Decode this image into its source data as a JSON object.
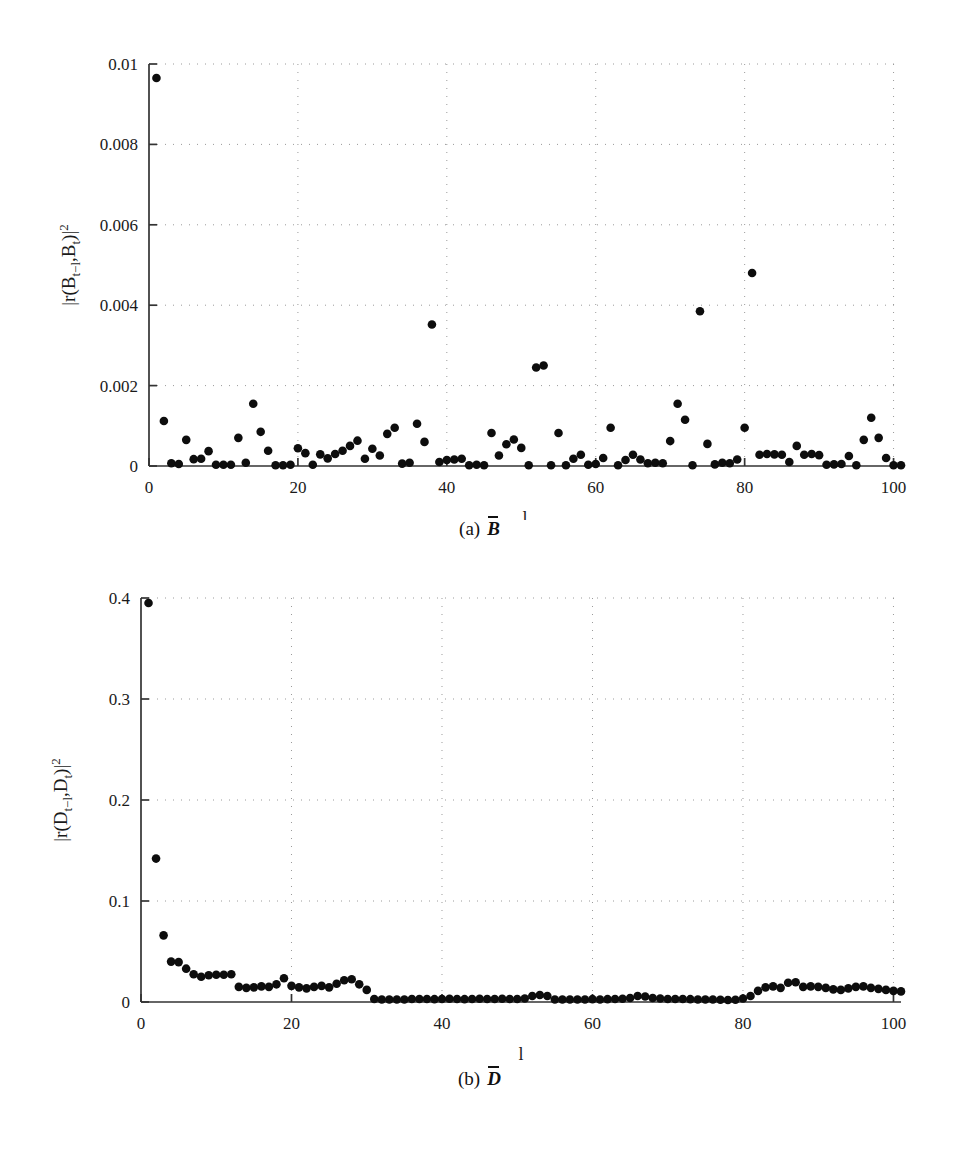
{
  "figure": {
    "background": "#ffffff",
    "marker_color": "#0d0d0d",
    "axis_color": "#333333",
    "grid_color": "#9a9a9a"
  },
  "panels": [
    {
      "id": "panel-a",
      "caption_label": "(a)",
      "caption_symbol": "B",
      "caption_overbar": true,
      "xlabel": "l",
      "ylabel_text": "|r(B_t-l ,B_t)|^2",
      "ylabel_parts": {
        "open": "|r(B",
        "sub1": "t−l",
        "comma": ",B",
        "sub2": "t",
        "close": ")|",
        "sup": "2"
      },
      "x_ticks": [
        "0",
        "20",
        "40",
        "60",
        "80",
        "100"
      ],
      "y_ticks": [
        "0",
        "0.002",
        "0.004",
        "0.006",
        "0.008",
        "0.01"
      ]
    },
    {
      "id": "panel-b",
      "caption_label": "(b)",
      "caption_symbol": "D",
      "caption_overbar": true,
      "xlabel": "l",
      "ylabel_text": "|r(D_t-l ,D_t)|^2",
      "ylabel_parts": {
        "open": "|r(D",
        "sub1": "t−l",
        "comma": ",D",
        "sub2": "t",
        "close": ")|",
        "sup": "2"
      },
      "x_ticks": [
        "0",
        "20",
        "40",
        "60",
        "80",
        "100"
      ],
      "y_ticks": [
        "0",
        "0.1",
        "0.2",
        "0.3",
        "0.4"
      ]
    }
  ],
  "chart_data": [
    {
      "type": "scatter",
      "panel": "a",
      "title": "(a) B̄",
      "xlabel": "l",
      "ylabel": "|r(B_{t-l},B_t)|^2",
      "xlim": [
        0,
        101
      ],
      "ylim": [
        0,
        0.01
      ],
      "xticks": [
        0,
        20,
        40,
        60,
        80,
        100
      ],
      "yticks": [
        0,
        0.002,
        0.004,
        0.006,
        0.008,
        0.01
      ],
      "grid": true,
      "legend": null,
      "marker": "filled-circle",
      "x": [
        1,
        2,
        3,
        4,
        5,
        6,
        7,
        8,
        9,
        10,
        11,
        12,
        13,
        14,
        15,
        16,
        17,
        18,
        19,
        20,
        21,
        22,
        23,
        24,
        25,
        26,
        27,
        28,
        29,
        30,
        31,
        32,
        33,
        34,
        35,
        36,
        37,
        38,
        39,
        40,
        41,
        42,
        43,
        44,
        45,
        46,
        47,
        48,
        49,
        50,
        51,
        52,
        53,
        54,
        55,
        56,
        57,
        58,
        59,
        60,
        61,
        62,
        63,
        64,
        65,
        66,
        67,
        68,
        69,
        70,
        71,
        72,
        73,
        74,
        75,
        76,
        77,
        78,
        79,
        80,
        81,
        82,
        83,
        84,
        85,
        86,
        87,
        88,
        89,
        90,
        91,
        92,
        93,
        94,
        95,
        96,
        97,
        98,
        99,
        100,
        101
      ],
      "y": [
        0.00965,
        0.00112,
        7e-05,
        5e-05,
        0.00065,
        0.00017,
        0.00018,
        0.00037,
        3e-05,
        3e-05,
        3e-05,
        0.0007,
        8e-05,
        0.00155,
        0.00085,
        0.00038,
        2e-05,
        2e-05,
        3e-05,
        0.00044,
        0.00032,
        3e-05,
        0.00029,
        0.00019,
        0.0003,
        0.00038,
        0.0005,
        0.00063,
        0.00018,
        0.00043,
        0.00026,
        0.0008,
        0.00095,
        6e-05,
        8e-05,
        0.00105,
        0.0006,
        0.00352,
        0.0001,
        0.00015,
        0.00016,
        0.00018,
        2e-05,
        3e-05,
        2e-05,
        0.00082,
        0.00026,
        0.00054,
        0.00066,
        0.00045,
        2e-05,
        0.00245,
        0.0025,
        2e-05,
        0.00082,
        2e-05,
        0.00018,
        0.00028,
        3e-05,
        5e-05,
        0.0002,
        0.00095,
        2e-05,
        0.00015,
        0.00028,
        0.00016,
        7e-05,
        8e-05,
        7e-05,
        0.00062,
        0.00155,
        0.00115,
        2e-05,
        0.00385,
        0.00055,
        4e-05,
        8e-05,
        7e-05,
        0.00016,
        0.00095,
        0.0048,
        0.00028,
        0.0003,
        0.00029,
        0.00028,
        0.0001,
        0.0005,
        0.00028,
        0.0003,
        0.00027,
        3e-05,
        4e-05,
        5e-05,
        0.00025,
        2e-05,
        0.00065,
        0.0012,
        0.0007,
        0.0002,
        2e-05,
        2e-05
      ]
    },
    {
      "type": "scatter",
      "panel": "b",
      "title": "(b) D̄",
      "xlabel": "l",
      "ylabel": "|r(D_{t-l},D_t)|^2",
      "xlim": [
        0,
        101
      ],
      "ylim": [
        0,
        0.4
      ],
      "xticks": [
        0,
        20,
        40,
        60,
        80,
        100
      ],
      "yticks": [
        0,
        0.1,
        0.2,
        0.3,
        0.4
      ],
      "grid": true,
      "legend": null,
      "marker": "filled-circle",
      "x": [
        1,
        2,
        3,
        4,
        5,
        6,
        7,
        8,
        9,
        10,
        11,
        12,
        13,
        14,
        15,
        16,
        17,
        18,
        19,
        20,
        21,
        22,
        23,
        24,
        25,
        26,
        27,
        28,
        29,
        30,
        31,
        32,
        33,
        34,
        35,
        36,
        37,
        38,
        39,
        40,
        41,
        42,
        43,
        44,
        45,
        46,
        47,
        48,
        49,
        50,
        51,
        52,
        53,
        54,
        55,
        56,
        57,
        58,
        59,
        60,
        61,
        62,
        63,
        64,
        65,
        66,
        67,
        68,
        69,
        70,
        71,
        72,
        73,
        74,
        75,
        76,
        77,
        78,
        79,
        80,
        81,
        82,
        83,
        84,
        85,
        86,
        87,
        88,
        89,
        90,
        91,
        92,
        93,
        94,
        95,
        96,
        97,
        98,
        99,
        100,
        101
      ],
      "y": [
        0.395,
        0.142,
        0.066,
        0.04,
        0.0395,
        0.033,
        0.0275,
        0.025,
        0.0265,
        0.027,
        0.027,
        0.0275,
        0.015,
        0.014,
        0.0145,
        0.0155,
        0.015,
        0.0175,
        0.0235,
        0.016,
        0.0145,
        0.0135,
        0.015,
        0.016,
        0.0145,
        0.018,
        0.0215,
        0.0225,
        0.0175,
        0.012,
        0.003,
        0.0025,
        0.0025,
        0.0025,
        0.0025,
        0.003,
        0.003,
        0.003,
        0.0028,
        0.003,
        0.0032,
        0.003,
        0.0028,
        0.003,
        0.0032,
        0.003,
        0.003,
        0.0032,
        0.003,
        0.003,
        0.0035,
        0.006,
        0.007,
        0.006,
        0.0025,
        0.0025,
        0.0025,
        0.0025,
        0.0025,
        0.0028,
        0.0025,
        0.0028,
        0.003,
        0.0032,
        0.004,
        0.006,
        0.0055,
        0.004,
        0.0035,
        0.003,
        0.003,
        0.003,
        0.0028,
        0.0025,
        0.0025,
        0.0025,
        0.0022,
        0.002,
        0.0022,
        0.0035,
        0.006,
        0.011,
        0.0145,
        0.0155,
        0.014,
        0.019,
        0.0195,
        0.015,
        0.0155,
        0.015,
        0.014,
        0.0125,
        0.012,
        0.0135,
        0.015,
        0.0155,
        0.014,
        0.013,
        0.012,
        0.011,
        0.0105
      ]
    }
  ]
}
